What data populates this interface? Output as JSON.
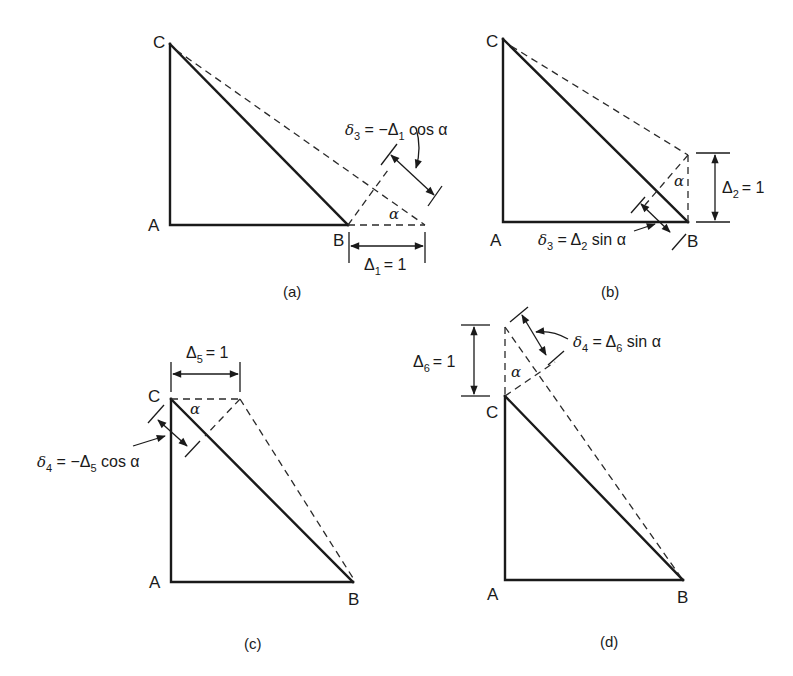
{
  "figure": {
    "panels": [
      {
        "id": "a",
        "caption": "(a)",
        "nodes": {
          "A": "A",
          "B": "B",
          "C": "C"
        },
        "angle_label": "α",
        "displacement": {
          "symbol": "Δ",
          "index": "1",
          "value": "= 1"
        },
        "relation": {
          "lhs": "δ",
          "lhs_index": "3",
          "eq": " = −",
          "rhs": "Δ",
          "rhs_index": "1",
          "func": " cos α"
        }
      },
      {
        "id": "b",
        "caption": "(b)",
        "nodes": {
          "A": "A",
          "B": "B",
          "C": "C"
        },
        "angle_label": "α",
        "displacement": {
          "symbol": "Δ",
          "index": "2",
          "value": "= 1"
        },
        "relation": {
          "lhs": "δ",
          "lhs_index": "3",
          "eq": " = ",
          "rhs": "Δ",
          "rhs_index": "2",
          "func": " sin α"
        }
      },
      {
        "id": "c",
        "caption": "(c)",
        "nodes": {
          "A": "A",
          "B": "B",
          "C": "C"
        },
        "angle_label": "α",
        "displacement": {
          "symbol": "Δ",
          "index": "5",
          "value": "= 1"
        },
        "relation": {
          "lhs": "δ",
          "lhs_index": "4",
          "eq": " = −",
          "rhs": "Δ",
          "rhs_index": "5",
          "func": " cos α"
        }
      },
      {
        "id": "d",
        "caption": "(d)",
        "nodes": {
          "A": "A",
          "B": "B",
          "C": "C"
        },
        "angle_label": "α",
        "displacement": {
          "symbol": "Δ",
          "index": "6",
          "value": "= 1"
        },
        "relation": {
          "lhs": "δ",
          "lhs_index": "4",
          "eq": " = ",
          "rhs": "Δ",
          "rhs_index": "6",
          "func": " sin α"
        }
      }
    ],
    "colors": {
      "ink": "#1a1a1a",
      "background": "#ffffff"
    }
  }
}
